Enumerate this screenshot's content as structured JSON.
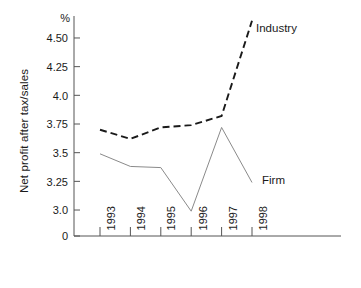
{
  "chart_data": {
    "type": "line",
    "title": "",
    "xlabel": "",
    "ylabel": "Net profit after tax/sales",
    "unit": "%",
    "categories": [
      "1993",
      "1994",
      "1995",
      "1996",
      "1997",
      "1998"
    ],
    "ytick_labels": [
      "4.50",
      "4.25",
      "4.0",
      "3.75",
      "3.5",
      "3.25",
      "3.0",
      "0"
    ],
    "ytick_values": [
      4.5,
      4.25,
      4.0,
      3.75,
      3.5,
      3.25,
      3.0,
      0
    ],
    "ylim": [
      3.0,
      4.75
    ],
    "axis_break": true,
    "grid": false,
    "legend_position": "inline-annotation",
    "series": [
      {
        "name": "Industry",
        "style": "dashed",
        "color": "#1a1a1a",
        "values": [
          3.7,
          3.62,
          3.72,
          3.74,
          3.82,
          4.65
        ]
      },
      {
        "name": "Firm",
        "style": "solid",
        "color": "#8a8a8a",
        "values": [
          3.49,
          3.38,
          3.37,
          2.99,
          3.72,
          3.24
        ]
      }
    ]
  },
  "annotations": {
    "industry": "Industry",
    "firm": "Firm"
  }
}
